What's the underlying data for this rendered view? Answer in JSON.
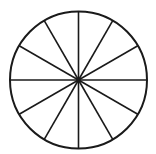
{
  "diagram": {
    "type": "divided-circle",
    "sectors": 12,
    "center": [
      78.5,
      80
    ],
    "radius": 68.5,
    "stroke_color": "#1a1a1a",
    "fill_color": "#ffffff",
    "circle_stroke_width": 2,
    "line_stroke_width": 1.6,
    "center_dot_radius": 2.2
  }
}
